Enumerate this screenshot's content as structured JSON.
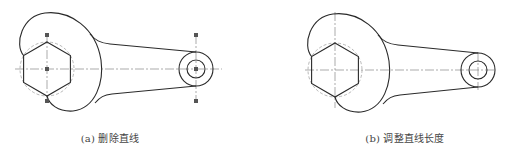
{
  "figures": [
    {
      "id": "a",
      "caption": "(a) 删除直线",
      "show_grips": true,
      "offset_x": 0
    },
    {
      "id": "b",
      "caption": "(b) 调整直线长度",
      "show_grips": false,
      "offset_x": 278
    }
  ],
  "colors": {
    "outline": "#2a2a2a",
    "centerline": "#888888",
    "grip": "#555555",
    "caption": "#444444"
  }
}
